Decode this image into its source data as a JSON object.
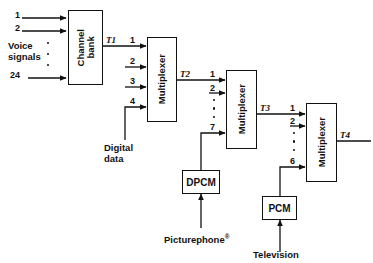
{
  "diagram": {
    "type": "block-diagram",
    "width": 373,
    "height": 263,
    "line_color": "#111111",
    "background": "#ffffff"
  },
  "blocks": {
    "channel_bank": {
      "label": "Channel\nbank",
      "line1": "Channel",
      "line2": "bank"
    },
    "mux1": {
      "label": "Multiplexer"
    },
    "mux2": {
      "label": "Multiplexer"
    },
    "mux3": {
      "label": "Multiplexer"
    },
    "dpcm": {
      "label": "DPCM"
    },
    "pcm": {
      "label": "PCM"
    }
  },
  "sources": {
    "voice": {
      "line1": "Voice",
      "line2": "signals",
      "first": "1",
      "second": "2",
      "last": "24",
      "count": 24
    },
    "digital_data": {
      "line1": "Digital",
      "line2": "data"
    },
    "picturephone": {
      "label": "Picturephone",
      "mark": "®"
    },
    "television": {
      "label": "Television"
    }
  },
  "signals": {
    "t1": "T1",
    "t2": "T2",
    "t3": "T3",
    "t4": "T4"
  },
  "inputs": {
    "mux1": [
      "1",
      "2",
      "3",
      "4"
    ],
    "mux2": [
      "1",
      "2",
      "7"
    ],
    "mux3": [
      "1",
      "2",
      "6"
    ]
  },
  "notes": {
    "mux1_inputs_count": 4,
    "mux2_inputs_count": 7,
    "mux3_inputs_count": 6
  }
}
